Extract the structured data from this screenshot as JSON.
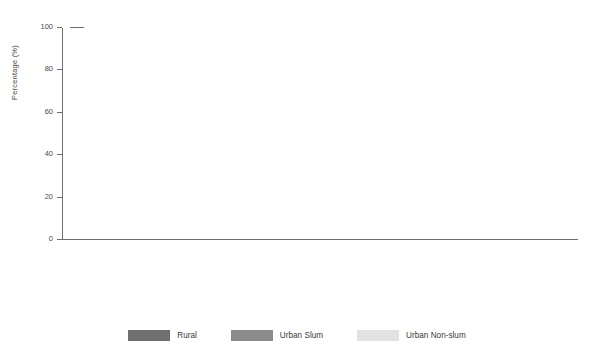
{
  "chart_data": {
    "type": "bar",
    "title": "",
    "xlabel": "",
    "ylabel": "Percentage (%)",
    "ylim": [
      0,
      100
    ],
    "yticks": [
      0,
      20,
      40,
      60,
      80,
      100
    ],
    "grid": false,
    "legend_position": "bottom-center",
    "legend": [
      "Rural",
      "Urban Slum",
      "Urban Non-slum"
    ],
    "series_colors": {
      "Rural": "#6f6f70",
      "Urban Slum": "#8b8b8c",
      "Urban Non-slum": "#e2e2e2"
    },
    "panels": [
      {
        "caption": "Men",
        "categories": [
          "Burkina Faso",
          "Côte d'Ivoire",
          "Gabon",
          "Ghana",
          "Nigeria",
          "Rwanda",
          "Uganda",
          "United Republic of Tanzania",
          "Zambia"
        ],
        "series": [
          {
            "name": "Rural",
            "values": [
              86,
              42,
              62,
              29.5,
              25,
              60,
              20,
              80,
              46.5
            ]
          },
          {
            "name": "Urban Slum",
            "values": [
              68,
              36.5,
              71,
              31,
              23,
              55,
              21,
              68.5,
              23
            ]
          },
          {
            "name": "Urban Non-slum",
            "values": [
              40,
              37.5,
              68.5,
              30.5,
              6,
              10,
              25,
              50,
              17.5
            ]
          }
        ]
      },
      {
        "caption": "Women",
        "categories": [
          "Burkina Faso",
          "Côte d'Ivoire",
          "Gabon",
          "Ghana",
          "Nigeria",
          "Rwanda",
          "Uganda",
          "United Republic of Tanzania",
          "Zambia"
        ],
        "series": [
          {
            "name": "Rural",
            "values": [
              99,
              81,
              83,
              94.5,
              79,
              60,
              82,
              94.5,
              92
            ]
          },
          {
            "name": "Urban Slum",
            "values": [
              84,
              88,
              77,
              89,
              79,
              67,
              74,
              70,
              73.5
            ]
          },
          {
            "name": "Urban Non-slum",
            "values": [
              42,
              69,
              76,
              81,
              72,
              60.5,
              76,
              69,
              59
            ]
          }
        ]
      }
    ]
  }
}
